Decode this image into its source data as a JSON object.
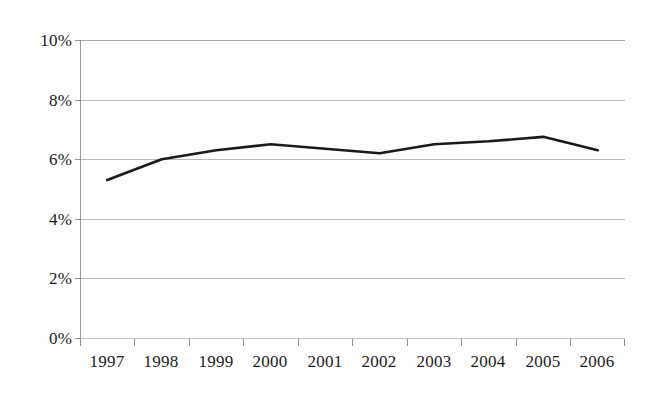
{
  "chart_data": {
    "type": "line",
    "title": "",
    "subtitle": "",
    "xlabel": "",
    "ylabel": "",
    "categories": [
      "1997",
      "1998",
      "1999",
      "2000",
      "2001",
      "2002",
      "2003",
      "2004",
      "2005",
      "2006"
    ],
    "values": [
      5.3,
      6.0,
      6.3,
      6.5,
      6.35,
      6.2,
      6.5,
      6.6,
      6.75,
      6.3
    ],
    "series": [
      {
        "name": "",
        "values": [
          5.3,
          6.0,
          6.3,
          6.5,
          6.35,
          6.2,
          6.5,
          6.6,
          6.75,
          6.3
        ],
        "color": "#1a1a1a"
      }
    ],
    "ylim": [
      0,
      10
    ],
    "y_ticks": [
      0,
      2,
      4,
      6,
      8,
      10
    ],
    "y_tick_labels": [
      "0%",
      "2%",
      "4%",
      "6%",
      "8%",
      "10%"
    ],
    "value_suffix": "%",
    "grid": true,
    "grid_axis": "y",
    "legend": false,
    "legend_position": "none",
    "markers": false,
    "line_width": 2.6,
    "grid_color": "#b9b9b9",
    "axis_color": "#9a9a9a",
    "text_color": "#1b1b1b",
    "background_color": "#fefefe"
  },
  "axes": {
    "y_tick_labels": [
      "10%",
      "8%",
      "6%",
      "4%",
      "2%",
      "0%"
    ],
    "x_tick_labels": [
      "1997",
      "1998",
      "1999",
      "2000",
      "2001",
      "2002",
      "2003",
      "2004",
      "2005",
      "2006"
    ]
  }
}
